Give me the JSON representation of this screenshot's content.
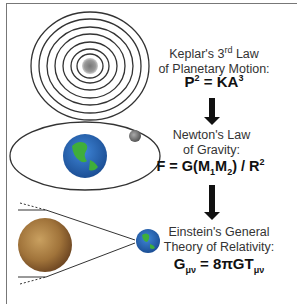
{
  "sections": [
    {
      "title_line1": "Keplar's 3",
      "title_sup": "rd",
      "title_line1_end": " Law",
      "title_line2": "of Planetary Motion:",
      "equation": {
        "lhs": "P",
        "lhs_sup": "2",
        "mid": " = KA",
        "rhs_sup": "3"
      }
    },
    {
      "title_line1": "Newton's Law",
      "title_line2": "of Gravity:",
      "equation": {
        "text1": "F = G(M",
        "sub1": "1",
        "text2": "M",
        "sub2": "2",
        "text3": ") / R",
        "sup": "2"
      }
    },
    {
      "title_line1": "Einstein's General",
      "title_line2": "Theory of Relativity:",
      "equation": {
        "text1": "G",
        "sub1": "μν",
        "text2": " = 8πGT",
        "sub2": "μν"
      }
    }
  ],
  "colors": {
    "frame": "#777777",
    "arrow": "#111111",
    "orbit": "#333333",
    "earth_ocean": "#2f6fc0",
    "earth_land": "#3fae3a",
    "mars": "#9a6a32"
  }
}
